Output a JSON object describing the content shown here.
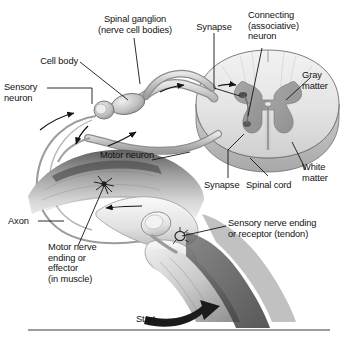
{
  "figure": {
    "background_color": "#ffffff",
    "ink_color": "#121212",
    "gray_matter_color": "#9a9a9a",
    "white_matter_color": "#d8d8d8",
    "nerve_color": "#b8b8b8",
    "tissue_color": "#c4c4c4"
  },
  "labels": {
    "spinal_ganglion": "Spinal ganglion\n(nerve cell bodies)",
    "cell_body": "Cell body",
    "sensory_neuron": "Sensory\nneuron",
    "synapse_top": "Synapse",
    "connecting_neuron": "Connecting\n(associative)\nneuron",
    "gray_matter": "Gray\nmatter",
    "white_matter": "White\nmatter",
    "spinal_cord": "Spinal cord",
    "synapse_bottom": "Synapse",
    "motor_neuron": "Motor neuron",
    "axon": "Axon",
    "motor_nerve_ending": "Motor nerve\nending or\neffector\n(in muscle)",
    "sensory_nerve_ending": "Sensory nerve ending\nor receptor (tendon)",
    "start": "Start"
  },
  "diagram_parts": {
    "structures": [
      "spinal cord cross-section",
      "gray matter butterfly",
      "white matter",
      "central canal",
      "spinal ganglion",
      "sensory neuron",
      "motor neuron",
      "connecting neuron",
      "knee joint",
      "patella",
      "femur",
      "tibia",
      "quadriceps muscle",
      "patellar tendon"
    ],
    "flow_arrows": [
      "impulse toward ganglion",
      "impulse into dorsal horn",
      "impulse out ventral horn",
      "impulse to muscle",
      "leg kick start"
    ]
  }
}
